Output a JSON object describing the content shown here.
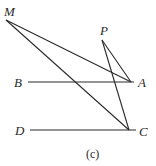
{
  "diagram": {
    "caption": "(c)",
    "points": {
      "M": {
        "label": "M",
        "x": 6,
        "y": 20
      },
      "P": {
        "label": "P",
        "x": 102,
        "y": 40
      },
      "A": {
        "label": "A",
        "x": 131,
        "y": 82
      },
      "B": {
        "label": "B",
        "x": 28,
        "y": 82
      },
      "C": {
        "label": "C",
        "x": 129,
        "y": 130
      },
      "D": {
        "label": "D",
        "x": 30,
        "y": 130
      }
    },
    "segments": [
      [
        "B",
        "A"
      ],
      [
        "D",
        "C"
      ],
      [
        "M",
        "A"
      ],
      [
        "M",
        "C"
      ],
      [
        "P",
        "A"
      ],
      [
        "P",
        "C"
      ]
    ]
  }
}
